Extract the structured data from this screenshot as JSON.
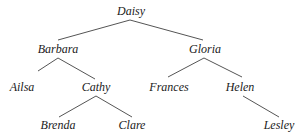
{
  "diagram": {
    "type": "tree",
    "line_color": "#555555",
    "nodes": [
      {
        "id": "daisy",
        "label": "Daisy",
        "x": 131,
        "y": 11
      },
      {
        "id": "barbara",
        "label": "Barbara",
        "x": 58,
        "y": 49
      },
      {
        "id": "gloria",
        "label": "Gloria",
        "x": 205,
        "y": 49
      },
      {
        "id": "ailsa",
        "label": "Ailsa",
        "x": 22,
        "y": 87
      },
      {
        "id": "cathy",
        "label": "Cathy",
        "x": 96,
        "y": 87
      },
      {
        "id": "frances",
        "label": "Frances",
        "x": 169,
        "y": 87
      },
      {
        "id": "helen",
        "label": "Helen",
        "x": 240,
        "y": 87
      },
      {
        "id": "brenda",
        "label": "Brenda",
        "x": 58,
        "y": 125
      },
      {
        "id": "clare",
        "label": "Clare",
        "x": 132,
        "y": 125
      },
      {
        "id": "lesley",
        "label": "Lesley",
        "x": 279,
        "y": 125
      }
    ],
    "edges": [
      [
        "daisy",
        "barbara"
      ],
      [
        "daisy",
        "gloria"
      ],
      [
        "barbara",
        "ailsa"
      ],
      [
        "barbara",
        "cathy"
      ],
      [
        "gloria",
        "frances"
      ],
      [
        "gloria",
        "helen"
      ],
      [
        "cathy",
        "brenda"
      ],
      [
        "cathy",
        "clare"
      ],
      [
        "helen",
        "lesley"
      ]
    ]
  }
}
